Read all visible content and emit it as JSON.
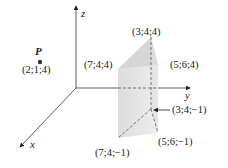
{
  "axes": {
    "x_label": "x",
    "y_label": "y",
    "z_label": "z"
  },
  "point_p": {
    "name": "P",
    "coords": "(2;1;4)"
  },
  "prism": {
    "top": [
      "(7;4;4)",
      "(3;4;4)",
      "(5;6;4)"
    ],
    "bottom": [
      "(7;4;−1)",
      "(3;4;−1)",
      "(5;6;−1)"
    ]
  },
  "colors": {
    "face_fill": "#d9d9d9",
    "face_light": "#e8e8e8",
    "axis": "#333333"
  }
}
